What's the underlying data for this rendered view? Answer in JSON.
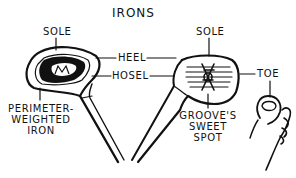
{
  "diagram": {
    "title": "IRONS",
    "labels": {
      "left_sole": "SOLE",
      "right_sole": "SOLE",
      "heel": "HEEL",
      "hosel": "HOSEL",
      "toe": "TOE",
      "perimeter": [
        "PERIMETER-",
        "WEIGHTED",
        "IRON"
      ],
      "sweet_spot": [
        "GROOVE'S",
        "SWEET",
        "SPOT"
      ]
    },
    "illustrations": {
      "left_club": "perimeter-weighted-iron-head",
      "right_club": "grooved-iron-head",
      "foot": "foot-with-big-toe"
    },
    "colors": {
      "ink": "#111111",
      "background": "#ffffff"
    }
  }
}
